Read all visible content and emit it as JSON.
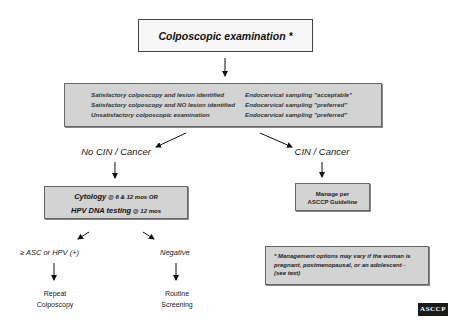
{
  "diagram": {
    "start": {
      "label": "Colposcopic examination *"
    },
    "conditions_box": {
      "rows": [
        {
          "condition": "Satisfactory colposcopy and lesion identified",
          "sampling": "Endocervical sampling \"acceptable\""
        },
        {
          "condition": "Satisfactory colposcopy and NO lesion identified",
          "sampling": "Endocervical sampling \"preferred\""
        },
        {
          "condition": "Unsatisfactory colposcopic examination",
          "sampling": "Endocervical sampling \"preferred\""
        }
      ]
    },
    "branches": {
      "left": {
        "label": "No CIN / Cancer",
        "followup": {
          "line1_bold": "Cytology",
          "line1_rest": " @ 6 & 12 mos OR",
          "line2_bold": "HPV DNA testing",
          "line2_rest": " @ 12 mos"
        },
        "results": [
          {
            "label": "≥ ASC or HPV (+)",
            "outcome_line1": "Repeat",
            "outcome_line2": "Colposcopy"
          },
          {
            "label": "Negative",
            "outcome_line1": "Routine",
            "outcome_line2": "Screening"
          }
        ]
      },
      "right": {
        "label": "CIN / Cancer",
        "action_line1": "Manage per",
        "action_line2": "ASCCP Guideline"
      }
    },
    "note": {
      "line1": "* Management options may vary if the woman is",
      "line2": "pregnant, postmenopausal, or an adolescent -",
      "line3": "(see text)"
    },
    "logo": {
      "text": "ASCCP"
    }
  },
  "colors": {
    "box_gray": "#d3d3d3",
    "box_white": "#f7f7f7",
    "border": "#555555",
    "logo_bg": "#1a1a1a"
  }
}
